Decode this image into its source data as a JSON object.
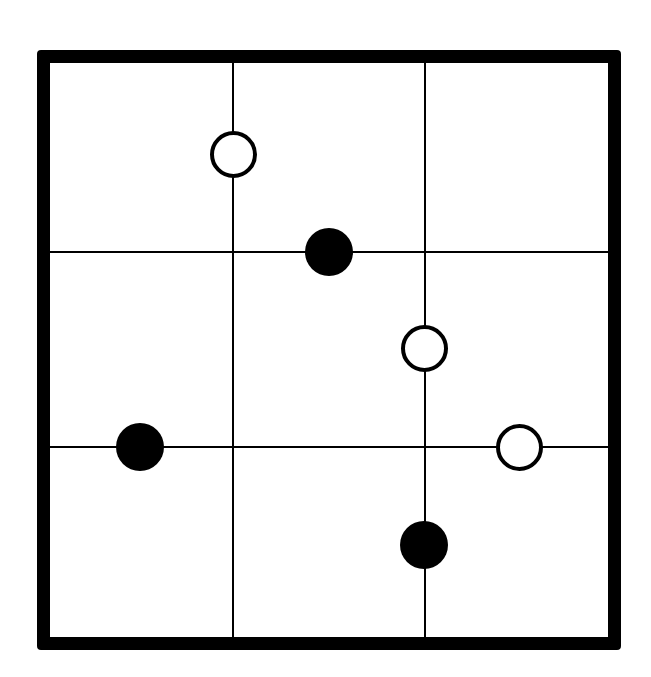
{
  "puzzle": {
    "type": "kropki-style-3x3",
    "rows": 3,
    "cols": 3,
    "frame": {
      "outer_left": 37,
      "outer_top": 50,
      "outer_right": 621,
      "outer_bottom": 650,
      "border_width": 13,
      "color": "#000000"
    },
    "vertical_lines_x": [
      233,
      425
    ],
    "horizontal_lines_y": [
      252,
      447
    ],
    "dots": [
      {
        "id": "dot-1",
        "color": "white",
        "cx": 234,
        "cy": 154,
        "position": "between r1c1 and r1c2"
      },
      {
        "id": "dot-2",
        "color": "black",
        "cx": 329,
        "cy": 252,
        "position": "between r1c2 and r2c2"
      },
      {
        "id": "dot-3",
        "color": "white",
        "cx": 425,
        "cy": 348,
        "position": "between r2c2 and r2c3"
      },
      {
        "id": "dot-4",
        "color": "black",
        "cx": 140,
        "cy": 447,
        "position": "between r2c1 and r3c1"
      },
      {
        "id": "dot-5",
        "color": "white",
        "cx": 520,
        "cy": 447,
        "position": "between r2c3 and r3c3"
      },
      {
        "id": "dot-6",
        "color": "black",
        "cx": 424,
        "cy": 545,
        "position": "between r3c2 and r3c3"
      }
    ],
    "colors": {
      "line": "#000000",
      "background": "#ffffff",
      "black_dot": "#000000",
      "white_dot_fill": "#ffffff"
    }
  }
}
